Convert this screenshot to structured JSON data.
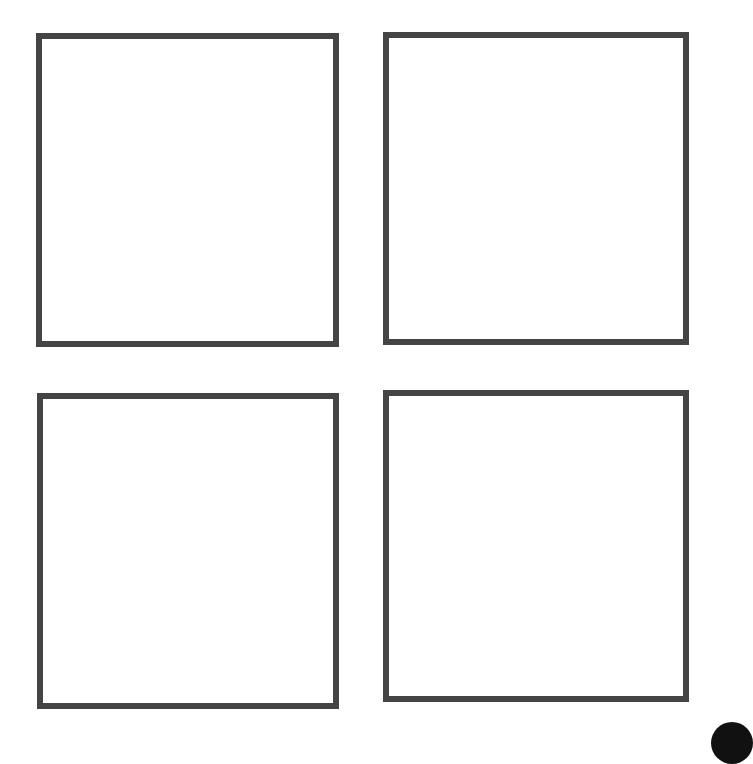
{
  "layout": {
    "grid": "2x2",
    "panels": [
      {
        "id": "panel-1",
        "position": "top-left",
        "content": ""
      },
      {
        "id": "panel-2",
        "position": "top-right",
        "content": ""
      },
      {
        "id": "panel-3",
        "position": "bottom-left",
        "content": ""
      },
      {
        "id": "panel-4",
        "position": "bottom-right",
        "content": ""
      }
    ]
  },
  "colors": {
    "background": "#ffffff",
    "panel_border": "#444444",
    "corner_dot": "#111111"
  },
  "corner_element": {
    "shape": "circle",
    "position": "bottom-right",
    "partially_visible": true
  }
}
